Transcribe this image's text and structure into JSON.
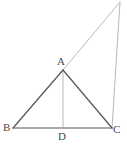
{
  "figure": {
    "type": "geometry-diagram",
    "background_color": "#ffffff",
    "canvas": {
      "width": 127,
      "height": 147
    },
    "colors": {
      "triangle_stroke": "#5a5a5a",
      "light_stroke": "#b9b9b9",
      "base_stroke": "#8f8f8f",
      "label_color": "#4a4a4a"
    },
    "labels": [
      {
        "id": "A",
        "text": "A",
        "x": 57,
        "y": 56
      },
      {
        "id": "B",
        "text": "B",
        "x": 3,
        "y": 122
      },
      {
        "id": "C",
        "text": "C",
        "x": 113,
        "y": 124
      },
      {
        "id": "D",
        "text": "D",
        "x": 58,
        "y": 131
      }
    ],
    "points": {
      "A": {
        "x": 63,
        "y": 70
      },
      "B": {
        "x": 13,
        "y": 128
      },
      "C": {
        "x": 112,
        "y": 128
      },
      "D": {
        "x": 63,
        "y": 128
      },
      "E": {
        "x": 120,
        "y": 2
      }
    },
    "segments": [
      {
        "name": "side-AB",
        "from": "B",
        "to": "A",
        "stroke": "#5a5a5a",
        "width": 1.3
      },
      {
        "name": "side-AC",
        "from": "A",
        "to": "C",
        "stroke": "#5a5a5a",
        "width": 1.3
      },
      {
        "name": "base-BC",
        "from": "B",
        "to": "C",
        "stroke": "#8f8f8f",
        "width": 1.3
      },
      {
        "name": "altitude-AD",
        "from": "A",
        "to": "D",
        "stroke": "#b9b9b9",
        "width": 1.0
      },
      {
        "name": "extension-AE",
        "from": "A",
        "to": "E",
        "stroke": "#b9b9b9",
        "width": 1.0
      },
      {
        "name": "segment-EC",
        "from": "E",
        "to": "C",
        "stroke": "#b9b9b9",
        "width": 1.0
      }
    ]
  }
}
